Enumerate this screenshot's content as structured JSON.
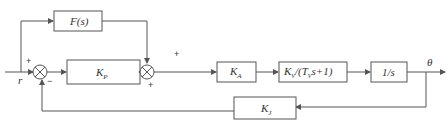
{
  "diagram": {
    "type": "control-block-diagram",
    "input": "r",
    "output": "θ",
    "blocks": {
      "feedforward": "F(s)",
      "proportional": "K_P",
      "amplifier": "K_A",
      "velocity": "K_V/(T_V s+1)",
      "integrator": "1/s",
      "feedback": "K_J"
    },
    "labels": {
      "feedforward": "F(s)",
      "kp_main": "K",
      "kp_sub": "P",
      "ka_main": "K",
      "ka_sub": "A",
      "kv_main": "K",
      "kv_sub": "V",
      "kv_mid": "/(T",
      "kv_sub2": "V",
      "kv_tail": "s+1)",
      "integrator": "1/s",
      "kj_main": "K",
      "kj_sub": "J",
      "input": "r",
      "output": "θ"
    },
    "junction1_signs": {
      "top": "+",
      "bottom": "−"
    },
    "junction2_signs": {
      "top": "+",
      "left": "+"
    },
    "colors": {
      "line": "#555555",
      "text": "#333333",
      "background": "#ffffff"
    }
  }
}
